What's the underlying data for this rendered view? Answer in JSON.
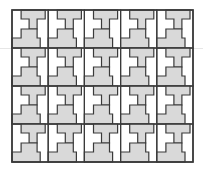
{
  "figure": {
    "type": "tessellation",
    "columns": 5,
    "rows": 4,
    "colors": {
      "background": "#ffffff",
      "tile_fill": "#d9d9d9",
      "outline": "#3a3a3a",
      "guide_line": "#e6e6e6"
    },
    "grid": {
      "x": 12,
      "y": 10,
      "cell_width": 36.2,
      "cell_height": 38
    }
  }
}
